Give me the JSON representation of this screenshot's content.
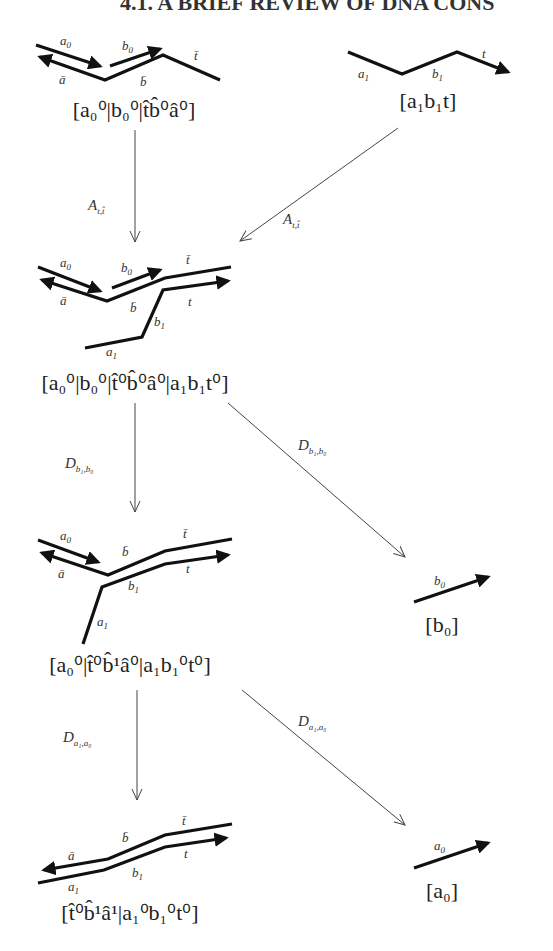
{
  "header": {
    "text": "4.1. A BRIEF REVIEW OF DNA CONS"
  },
  "states": {
    "s1": {
      "formula": "[a₀⁰|b₀⁰|t̂b̂⁰â⁰]",
      "labels": {
        "a0": "a",
        "a0_sub": "0",
        "abar": "ā",
        "b0": "b",
        "b0_sub": "0",
        "bbar": "b̄",
        "tbar": "t̄"
      }
    },
    "s2": {
      "formula": "[a₁b₁t]",
      "labels": {
        "a1": "a",
        "a1_sub": "1",
        "b1": "b",
        "b1_sub": "1",
        "t": "t"
      }
    },
    "s3": {
      "formula": "[a₀⁰|b₀⁰|t̂⁰b̂⁰â⁰|a₁b₁t⁰]",
      "labels": {
        "a0": "a",
        "a0_sub": "0",
        "abar": "ā",
        "b0": "b",
        "b0_sub": "0",
        "bbar": "b̄",
        "tbar": "t̄",
        "t": "t",
        "b1": "b",
        "b1_sub": "1",
        "a1": "a",
        "a1_sub": "1"
      }
    },
    "s4": {
      "formula": "[a₀⁰|t̂⁰b̂¹â⁰|a₁b₁⁰t⁰]",
      "labels": {
        "a0": "a",
        "a0_sub": "0",
        "abar": "ā",
        "bbar": "b̄",
        "tbar": "t̄",
        "t": "t",
        "b1": "b",
        "b1_sub": "1",
        "a1": "a",
        "a1_sub": "1"
      }
    },
    "s5": {
      "formula": "[b₀]",
      "labels": {
        "b0": "b",
        "b0_sub": "0"
      }
    },
    "s6": {
      "formula": "[t̂⁰b̂¹â¹|a₁⁰b₁⁰t⁰]",
      "labels": {
        "abar": "ā",
        "bbar": "b̄",
        "tbar": "t̄",
        "t": "t",
        "b1": "b",
        "b1_sub": "1",
        "a1": "a",
        "a1_sub": "1"
      }
    },
    "s7": {
      "formula": "[a₀]",
      "labels": {
        "a0": "a",
        "a0_sub": "0"
      }
    }
  },
  "transitions": [
    {
      "id": "t1",
      "from": "s1",
      "to": "s3",
      "label": "A",
      "label_sub": "t,t̂"
    },
    {
      "id": "t2",
      "from": "s2",
      "to": "s3",
      "label": "A",
      "label_sub": "t,t̂"
    },
    {
      "id": "t3",
      "from": "s3",
      "to": "s4",
      "label": "D",
      "label_sub": "b₁,b₀"
    },
    {
      "id": "t4",
      "from": "s3",
      "to": "s5",
      "label": "D",
      "label_sub": "b₁,b₀"
    },
    {
      "id": "t5",
      "from": "s4",
      "to": "s6",
      "label": "D",
      "label_sub": "a₁,a₀"
    },
    {
      "id": "t6",
      "from": "s4",
      "to": "s7",
      "label": "D",
      "label_sub": "a₁,a₀"
    }
  ]
}
